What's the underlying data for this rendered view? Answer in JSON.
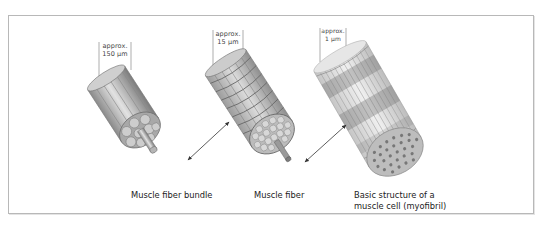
{
  "diagram": {
    "structures": [
      {
        "id": "bundle",
        "label": "Muscle fiber bundle",
        "scale_line1": "approx.",
        "scale_line2": "150 µm"
      },
      {
        "id": "fiber",
        "label": "Muscle fiber",
        "scale_line1": "approx.",
        "scale_line2": "15 µm"
      },
      {
        "id": "myofibril",
        "label_line1": "Basic structure of a",
        "label_line2": "muscle cell (myofibril)",
        "scale_line1": "approx.",
        "scale_line2": "1 µm"
      }
    ],
    "arrows": [
      {
        "from": "bundle",
        "to": "fiber",
        "type": "double-headed"
      },
      {
        "from": "fiber",
        "to": "myofibril",
        "type": "double-headed"
      }
    ],
    "colors": {
      "frame_border": "#b8b8b8",
      "illustration_gray": "#9a9a9a",
      "text": "#222222"
    }
  }
}
